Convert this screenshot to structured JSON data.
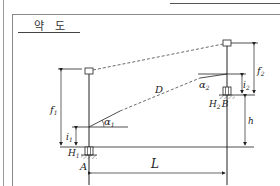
{
  "title": "약 도",
  "diagram": {
    "labels": {
      "D": "D",
      "alpha1": "α",
      "alpha1_sub": "1",
      "alpha2": "α",
      "alpha2_sub": "2",
      "f1": "f",
      "f1_sub": "1",
      "f2": "f",
      "f2_sub": "2",
      "i1": "i",
      "i1_sub": "1",
      "i2": "i",
      "i2_sub": "2",
      "H1": "H",
      "H1_sub": "1",
      "H2B": "H",
      "H2B_sub": "2",
      "B": "B",
      "A": "A",
      "h": "h",
      "L": "L"
    },
    "colors": {
      "line": "#222222",
      "dashed": "#444444",
      "frame": "#888888"
    }
  }
}
